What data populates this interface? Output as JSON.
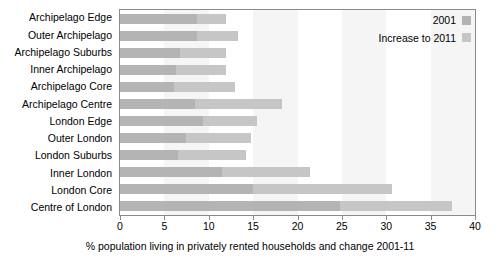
{
  "chart_data": {
    "type": "bar",
    "orientation": "horizontal",
    "stacked": true,
    "title": "",
    "xlabel": "% population living in privately rented households and change 2001-11",
    "ylabel": "",
    "xlim": [
      0,
      40
    ],
    "xticks": [
      0,
      5,
      10,
      15,
      20,
      25,
      30,
      35,
      40
    ],
    "xtick_labels": [
      "0",
      "5",
      "10",
      "15",
      "20",
      "25",
      "30",
      "35",
      "40"
    ],
    "grid": false,
    "legend_position": "top-right",
    "categories": [
      "Archipelago Edge",
      "Outer Archipelago",
      "Archipelago Suburbs",
      "Inner Archipelago",
      "Archipelago Core",
      "Archipelago Centre",
      "London Edge",
      "Outer London",
      "London Suburbs",
      "Inner London",
      "London Core",
      "Centre of London"
    ],
    "series": [
      {
        "name": "2001",
        "color": "#b4b4b4",
        "values": [
          8.7,
          8.7,
          6.8,
          6.3,
          6.1,
          8.4,
          9.3,
          7.4,
          6.5,
          11.5,
          15.0,
          24.8
        ]
      },
      {
        "name": "Increase to 2011",
        "color": "#c6c6c6",
        "values": [
          3.3,
          4.6,
          5.2,
          5.6,
          6.9,
          9.9,
          6.1,
          7.4,
          7.7,
          9.9,
          15.6,
          12.6
        ]
      }
    ],
    "totals": [
      12.0,
      13.3,
      12.0,
      11.9,
      13.0,
      18.3,
      15.4,
      14.8,
      14.2,
      21.4,
      30.6,
      37.4
    ]
  },
  "legend": {
    "items": [
      {
        "label": "2001",
        "color": "#b4b4b4"
      },
      {
        "label": "Increase to 2011",
        "color": "#c6c6c6"
      }
    ]
  },
  "colors": {
    "series_2001": "#b4b4b4",
    "series_increase": "#c6c6c6",
    "band": "#f5f5f5",
    "frame": "#8a8a8a",
    "text": "#000000",
    "background": "#ffffff"
  }
}
